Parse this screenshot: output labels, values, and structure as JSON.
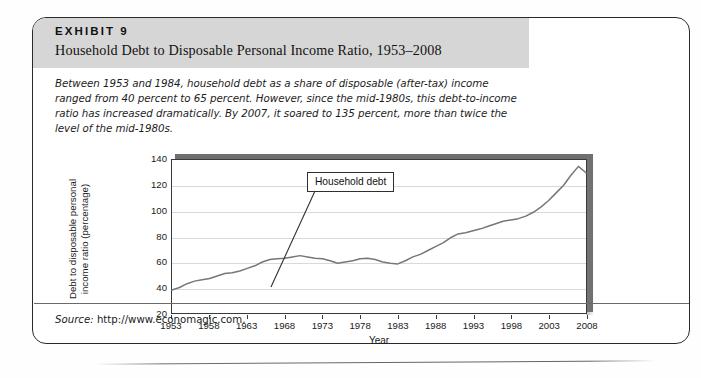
{
  "exhibit": {
    "label": "EXHIBIT 9",
    "title": "Household Debt to Disposable Personal Income Ratio, 1953–2008",
    "caption": "Between 1953 and 1984, household debt as a share of disposable (after-tax) income ranged from 40 percent to 65 percent. However, since the mid-1980s, this debt-to-income ratio has increased dramatically. By 2007, it soared to 135 percent, more than twice the level of the mid-1980s.",
    "source_word": "Source:",
    "source_value": "http://www.economagic.com."
  },
  "colors": {
    "header_band": "#d6d6d6",
    "card_border": "#2a2a2a",
    "series_line": "#777777",
    "gridline": "#d9d9d9",
    "plot_shadow": "#6f6f6f"
  },
  "chart_data": {
    "type": "line",
    "title": "Household Debt to Disposable Personal Income Ratio, 1953–2008",
    "xlabel": "Year",
    "ylabel": "Debt to disposable personal income ratio (percentage)",
    "ylabel_line1": "Debt to disposable personal",
    "ylabel_line2": "income ratio (percentage)",
    "xlim": [
      1953,
      2008
    ],
    "ylim": [
      20,
      140
    ],
    "yticks": [
      20,
      40,
      60,
      80,
      100,
      120,
      140
    ],
    "xticks": [
      1953,
      1958,
      1963,
      1968,
      1973,
      1978,
      1983,
      1988,
      1993,
      1998,
      2003,
      2008
    ],
    "grid": true,
    "legend": "none",
    "annotations": [
      {
        "text": "Household debt",
        "points_to_year": 1983,
        "points_to_value": 64
      }
    ],
    "series": [
      {
        "name": "Household debt to disposable personal income ratio",
        "x": [
          1953,
          1954,
          1955,
          1956,
          1957,
          1958,
          1959,
          1960,
          1961,
          1962,
          1963,
          1964,
          1965,
          1966,
          1967,
          1968,
          1969,
          1970,
          1971,
          1972,
          1973,
          1974,
          1975,
          1976,
          1977,
          1978,
          1979,
          1980,
          1981,
          1982,
          1983,
          1984,
          1985,
          1986,
          1987,
          1988,
          1989,
          1990,
          1991,
          1992,
          1993,
          1994,
          1995,
          1996,
          1997,
          1998,
          1999,
          2000,
          2001,
          2002,
          2003,
          2004,
          2005,
          2006,
          2007,
          2008
        ],
        "values": [
          38,
          40,
          43,
          45,
          46,
          47,
          49,
          51,
          51.5,
          53,
          55,
          57,
          60,
          62,
          62.5,
          63,
          64,
          65,
          64,
          63,
          62.5,
          61,
          59,
          60,
          61,
          62.5,
          63,
          62,
          60,
          59,
          58.5,
          61,
          64,
          66,
          69,
          72,
          75,
          79,
          82,
          83,
          84.5,
          86,
          88,
          90,
          92,
          93,
          94,
          96,
          99,
          103,
          108,
          114,
          120,
          128,
          135,
          130
        ]
      }
    ]
  }
}
